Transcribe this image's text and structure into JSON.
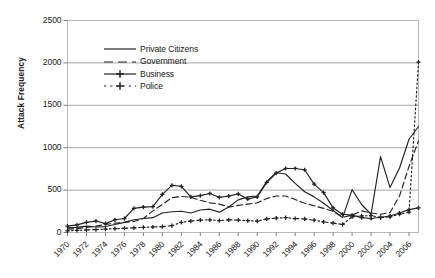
{
  "chart_data": {
    "type": "line",
    "title": "",
    "xlabel": "",
    "ylabel": "Attack Frequency",
    "ylim": [
      0,
      2500
    ],
    "ytick_values": [
      0,
      500,
      1000,
      1500,
      2000,
      2500
    ],
    "ytick_labels": [
      "0",
      "500",
      "1000",
      "1500",
      "2000",
      "2500"
    ],
    "grid": "horizontal",
    "xlim": [
      1970,
      2007
    ],
    "x": [
      1970,
      1971,
      1972,
      1973,
      1974,
      1975,
      1976,
      1977,
      1978,
      1979,
      1980,
      1981,
      1982,
      1983,
      1984,
      1985,
      1986,
      1987,
      1988,
      1989,
      1990,
      1991,
      1992,
      1993,
      1994,
      1995,
      1996,
      1997,
      1998,
      1999,
      2000,
      2001,
      2002,
      2003,
      2004,
      2005,
      2006,
      2007
    ],
    "xtick_labels": [
      "1970",
      "1972",
      "1974",
      "1976",
      "1978",
      "1980",
      "1982",
      "1984",
      "1986",
      "1988",
      "1990",
      "1992",
      "1994",
      "1996",
      "1998",
      "2000",
      "2002",
      "2004",
      "2006"
    ],
    "xtick_values": [
      1970,
      1972,
      1974,
      1976,
      1978,
      1980,
      1982,
      1984,
      1986,
      1988,
      1990,
      1992,
      1994,
      1996,
      1998,
      2000,
      2002,
      2004,
      2006
    ],
    "legend_position": "upper-left-inside",
    "series": [
      {
        "name": "Private Citizens",
        "style": "solid",
        "marker": "none",
        "color": "#222222",
        "values": [
          55,
          60,
          75,
          65,
          70,
          95,
          120,
          150,
          165,
          175,
          230,
          245,
          250,
          230,
          265,
          275,
          240,
          300,
          385,
          420,
          430,
          600,
          705,
          690,
          580,
          480,
          420,
          345,
          260,
          175,
          505,
          330,
          215,
          895,
          530,
          760,
          1100,
          1250
        ]
      },
      {
        "name": "Government",
        "style": "dashed",
        "marker": "none",
        "color": "#222222",
        "values": [
          40,
          45,
          60,
          75,
          95,
          110,
          120,
          130,
          165,
          255,
          330,
          410,
          425,
          415,
          380,
          350,
          335,
          300,
          320,
          335,
          350,
          400,
          430,
          430,
          390,
          345,
          315,
          285,
          250,
          180,
          205,
          255,
          230,
          215,
          235,
          430,
          780,
          1080
        ]
      },
      {
        "name": "Business",
        "style": "solid",
        "marker": "plus",
        "color": "#222222",
        "values": [
          75,
          90,
          120,
          135,
          105,
          150,
          165,
          285,
          300,
          305,
          450,
          555,
          545,
          420,
          435,
          460,
          415,
          430,
          455,
          395,
          420,
          590,
          700,
          755,
          755,
          740,
          570,
          470,
          290,
          215,
          205,
          175,
          165,
          180,
          195,
          230,
          270,
          290
        ]
      },
      {
        "name": "Police",
        "style": "dotted",
        "marker": "plus",
        "color": "#222222",
        "values": [
          20,
          25,
          30,
          35,
          40,
          45,
          50,
          55,
          60,
          65,
          70,
          80,
          120,
          135,
          145,
          150,
          140,
          150,
          145,
          140,
          135,
          160,
          170,
          175,
          165,
          160,
          145,
          125,
          110,
          95,
          185,
          195,
          200,
          175,
          185,
          215,
          240,
          2010
        ]
      }
    ]
  }
}
